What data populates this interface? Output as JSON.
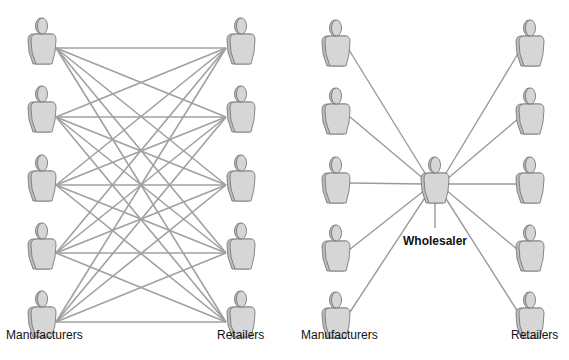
{
  "diagram": {
    "left_panel": {
      "title": "Without wholesaler",
      "manufacturers_label": "Manufacturers",
      "retailers_label": "Retailers",
      "manufacturer_count": 5,
      "retailer_count": 5,
      "connections": "every manufacturer connected to every retailer (25 links)"
    },
    "right_panel": {
      "manufacturers_label": "Manufacturers",
      "retailers_label": "Retailers",
      "hub_label": "Wholesaler",
      "manufacturer_count": 5,
      "retailer_count": 5,
      "connections": "each manufacturer and retailer connected to the wholesaler (10 links)"
    },
    "colors": {
      "line": "#a0a0a0",
      "figure_fill": "#d3d3d3",
      "figure_shade": "#bdbdbd",
      "figure_stroke": "#6e6e6e",
      "text": "#111111"
    },
    "icons": {
      "person": "person-silhouette-icon"
    }
  }
}
